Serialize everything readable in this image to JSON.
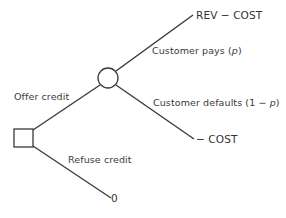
{
  "diagram": {
    "type": "decision-tree",
    "colors": {
      "line": "#3a3a3a",
      "text": "#3a3a3a",
      "background": "#ffffff"
    },
    "nodes": {
      "decision": {
        "shape": "square",
        "label": ""
      },
      "chance": {
        "shape": "circle",
        "label": ""
      }
    },
    "branches": {
      "offer_credit": "Offer credit",
      "refuse_credit": "Refuse credit",
      "customer_pays_prefix": "Customer pays (",
      "customer_pays_prob": "p",
      "customer_pays_suffix": ")",
      "customer_defaults_prefix": "Customer defaults (1 − ",
      "customer_defaults_prob": "p",
      "customer_defaults_suffix": ")"
    },
    "payoffs": {
      "pays": "REV − COST",
      "defaults": "− COST",
      "refuse": "0"
    }
  }
}
